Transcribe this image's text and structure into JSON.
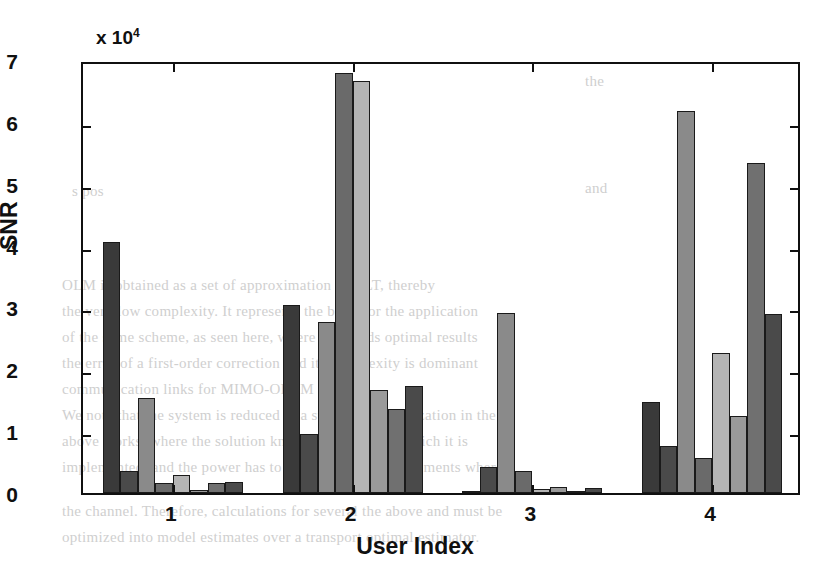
{
  "chart_data": {
    "type": "bar",
    "title": "",
    "xlabel": "User Index",
    "ylabel": "SNR",
    "y_axis_exponent_text": "x 10",
    "y_axis_exponent_power": "4",
    "y_multiplier": 10000,
    "categories": [
      "1",
      "2",
      "3",
      "4"
    ],
    "ylim": [
      0,
      7
    ],
    "yticks": [
      0,
      1,
      2,
      3,
      4,
      5,
      6,
      7
    ],
    "ytick_labels": [
      "0",
      "1",
      "2",
      "3",
      "4",
      "5",
      "6",
      "7"
    ],
    "xtick_labels": [
      "1",
      "2",
      "3",
      "4"
    ],
    "grid": false,
    "legend": "none",
    "bars_per_group": 8,
    "series": [
      {
        "name": "s1",
        "shade": "#3a3a3a",
        "values": [
          4.05,
          3.04,
          0.04,
          1.47
        ]
      },
      {
        "name": "s2",
        "shade": "#4a4a4a",
        "values": [
          0.35,
          0.96,
          0.42,
          0.76
        ]
      },
      {
        "name": "s3",
        "shade": "#8a8a8a",
        "values": [
          1.53,
          2.76,
          2.91,
          6.18
        ]
      },
      {
        "name": "s4",
        "shade": "#6a6a6a",
        "values": [
          0.16,
          6.79,
          0.35,
          0.57
        ]
      },
      {
        "name": "s5",
        "shade": "#b4b4b4",
        "values": [
          0.29,
          6.66,
          0.07,
          2.26
        ]
      },
      {
        "name": "s6",
        "shade": "#9a9a9a",
        "values": [
          0.05,
          1.67,
          0.1,
          1.24
        ]
      },
      {
        "name": "s7",
        "shade": "#707070",
        "values": [
          0.16,
          1.36,
          0.03,
          5.33
        ]
      },
      {
        "name": "s8",
        "shade": "#4a4a4a",
        "values": [
          0.17,
          1.73,
          0.08,
          2.9
        ]
      }
    ]
  },
  "bleed_text": [
    {
      "t": "the",
      "x": 585,
      "y": 68
    },
    {
      "t": "s pos",
      "x": 72,
      "y": 178
    },
    {
      "t": "and",
      "x": 585,
      "y": 175
    },
    {
      "t": "OLM is obtained as a set of approximation of GLT, thereby",
      "x": 62,
      "y": 272
    },
    {
      "t": "the very low complexity. It represents the basis for the application",
      "x": 62,
      "y": 298
    },
    {
      "t": "of the same scheme, as seen here, where it extends optimal results",
      "x": 62,
      "y": 324
    },
    {
      "t": "the error of a first-order correction and its complexity is dominant",
      "x": 62,
      "y": 350
    },
    {
      "t": "communication links for MIMO-OFDM systems.",
      "x": 62,
      "y": 376
    },
    {
      "t": "We note that the system is reduced to a sum-rate maximization in the",
      "x": 62,
      "y": 402
    },
    {
      "t": "above works, where the solution known in the data in which it is",
      "x": 62,
      "y": 428
    },
    {
      "t": "implemented, and the power has to be allocated to the elements where",
      "x": 62,
      "y": 454
    },
    {
      "t": "the channel. Therefore, calculations for several the above and must be",
      "x": 62,
      "y": 498
    },
    {
      "t": "optimized into model estimates over a transport optimal estimator.",
      "x": 62,
      "y": 524
    }
  ]
}
